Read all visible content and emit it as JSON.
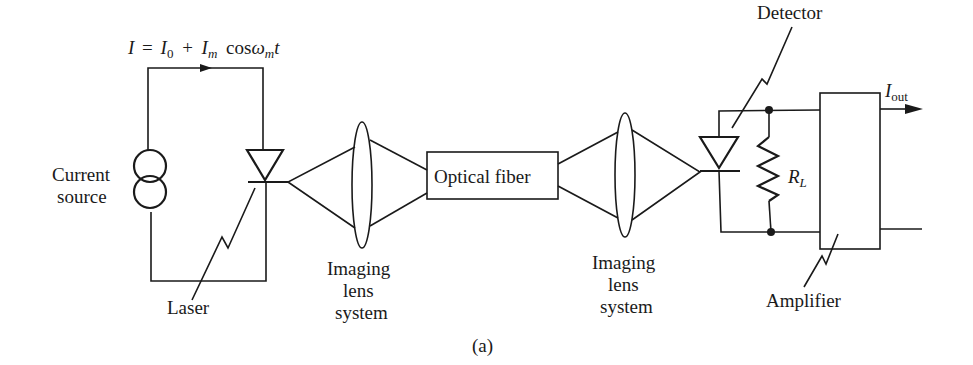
{
  "figure": {
    "caption": "(a)",
    "equation": {
      "lhs": "I",
      "eq": "=",
      "i0": "I",
      "i0_sub": "0",
      "plus": "+",
      "im": "I",
      "im_sub": "m",
      "cos": "cos",
      "omega": "ω",
      "omega_sub": "m",
      "t": "t"
    },
    "labels": {
      "current_line1": "Current",
      "current_line2": "source",
      "laser": "Laser",
      "lens1_line1": "Imaging",
      "lens1_line2": "lens",
      "lens1_line3": "system",
      "fiber": "Optical fiber",
      "lens2_line1": "Imaging",
      "lens2_line2": "lens",
      "lens2_line3": "system",
      "detector": "Detector",
      "rl": "R",
      "rl_sub": "L",
      "iout": "I",
      "iout_sub": "out",
      "amplifier": "Amplifier"
    }
  }
}
